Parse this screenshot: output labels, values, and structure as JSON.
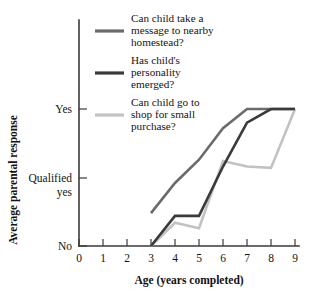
{
  "chart_data": {
    "type": "line",
    "title": "",
    "xlabel": "Age (years completed)",
    "ylabel": "Average parental response",
    "x_ticks": [
      "0",
      "1",
      "2",
      "3",
      "4",
      "5",
      "6",
      "7",
      "8",
      "9"
    ],
    "x_values": [
      0,
      1,
      2,
      3,
      4,
      5,
      6,
      7,
      8,
      9
    ],
    "xlim": [
      0,
      9
    ],
    "y_ticks": [
      "Yes",
      "Qualified yes",
      "No"
    ],
    "y_tick_values": [
      1.0,
      0.5,
      0.0
    ],
    "ylim": [
      0.0,
      1.0
    ],
    "grid": false,
    "legend_position": "upper-left-inside",
    "series": [
      {
        "name": "Can child take a message to nearby homestead?",
        "color": "#6b6b6b",
        "x": [
          3,
          4,
          5,
          6,
          7,
          8,
          9
        ],
        "values": [
          0.24,
          0.46,
          0.63,
          0.86,
          1.0,
          1.0,
          1.0
        ]
      },
      {
        "name": "Has child's personality emerged?",
        "color": "#3a3a3a",
        "x": [
          3,
          4,
          5,
          6,
          7,
          8,
          9
        ],
        "values": [
          0.0,
          0.22,
          0.22,
          0.58,
          0.9,
          1.0,
          1.0
        ]
      },
      {
        "name": "Can child go to shop for small purchase?",
        "color": "#c2c2c2",
        "x": [
          3,
          4,
          5,
          6,
          7,
          8,
          9
        ],
        "values": [
          0.0,
          0.17,
          0.13,
          0.62,
          0.58,
          0.57,
          1.0
        ]
      }
    ]
  },
  "axes": {
    "y_title": "Average parental response",
    "x_title": "Age (years completed)",
    "y_labels": {
      "high": "Yes",
      "mid_line1": "Qualified",
      "mid_line2": "yes",
      "low": "No"
    },
    "x_labels": [
      "0",
      "1",
      "2",
      "3",
      "4",
      "5",
      "6",
      "7",
      "8",
      "9"
    ]
  },
  "legend": {
    "items": [
      {
        "line1": "Can child take a",
        "line2": "message to nearby",
        "line3": "homestead?",
        "color": "#6b6b6b"
      },
      {
        "line1": "Has child's",
        "line2": "personality",
        "line3": "emerged?",
        "color": "#3a3a3a"
      },
      {
        "line1": "Can child go to",
        "line2": "shop for small",
        "line3": "purchase?",
        "color": "#c2c2c2"
      }
    ]
  },
  "colors": {
    "axis": "#3a3a3a",
    "text": "#141414",
    "background": "#ffffff"
  }
}
